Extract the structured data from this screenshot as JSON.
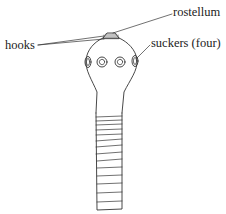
{
  "diagram": {
    "labels": {
      "rostellum": "rostellum",
      "hooks": "hooks",
      "suckers": "suckers (four)"
    },
    "colors": {
      "line": "#333333",
      "text": "#222222",
      "background": "#ffffff"
    },
    "segment_count": 14
  }
}
